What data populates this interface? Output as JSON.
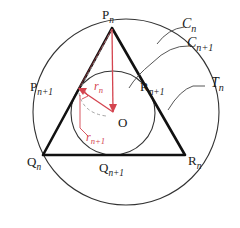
{
  "figure": {
    "kind": "geometry-diagram",
    "colors": {
      "stroke_dark": "#1a1a1a",
      "stroke_thin": "#444444",
      "accent_red": "#d4444f",
      "dashed_gray": "#9a9a9a",
      "background": "#ffffff"
    },
    "geometry": {
      "outer_circle": {
        "cx": 126,
        "cy": 112,
        "r": 93,
        "label": "C_n"
      },
      "inner_circle": {
        "cx": 113,
        "cy": 113,
        "r": 42,
        "label": "C_n+1"
      },
      "triangle_outer": {
        "apex": {
          "x": 112,
          "y": 28
        },
        "bottom_left": {
          "x": 43,
          "y": 155
        },
        "bottom_right": {
          "x": 185,
          "y": 155
        }
      },
      "center": {
        "x": 113,
        "y": 112,
        "label": "O"
      },
      "tangent_point_left": {
        "x": 78,
        "y": 88
      },
      "radius_r_n": {
        "from": "O",
        "to": "P_n"
      },
      "radius_r_n1": {
        "from": "O",
        "to": "P_n+1"
      }
    },
    "labels": {
      "apex_vertex": {
        "base": "P",
        "sub": "n"
      },
      "bottom_left_vertex": {
        "base": "Q",
        "sub": "n"
      },
      "bottom_right_vertex": {
        "base": "R",
        "sub": "n"
      },
      "left_tangent": {
        "base": "P",
        "sub": "n+1"
      },
      "right_tangent": {
        "base": "R",
        "sub": "n+1"
      },
      "bottom_tangent": {
        "base": "Q",
        "sub": "n+1"
      },
      "center": {
        "base": "O",
        "sub": ""
      },
      "outer_circle": {
        "base": "C",
        "sub": "n"
      },
      "inner_circle": {
        "base": "C",
        "sub": "n+1"
      },
      "triangle_name": {
        "base": "T",
        "sub": "n"
      },
      "radius_outer": {
        "base": "r",
        "sub": "n"
      },
      "radius_inner": {
        "base": "r",
        "sub": "n+1"
      }
    }
  }
}
